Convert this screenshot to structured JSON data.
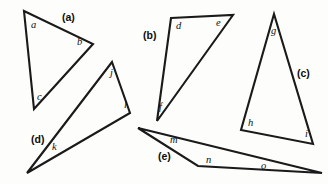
{
  "figure": {
    "canvas": {
      "width": 328,
      "height": 184
    },
    "background_color": "#fdfdfb",
    "stroke_color": "#1a1a1a",
    "label_color": "#111111",
    "triangles": [
      {
        "id": "a",
        "group_label": "(a)",
        "group_label_pos": {
          "x": 62,
          "y": 21
        },
        "points": "24,11 93,44 34,109",
        "angle_labels": [
          {
            "text": "a",
            "x": 31,
            "y": 28
          },
          {
            "text": "b",
            "x": 77,
            "y": 45
          },
          {
            "text": "c",
            "x": 37,
            "y": 100
          }
        ]
      },
      {
        "id": "b",
        "group_label": "(b)",
        "group_label_pos": {
          "x": 143,
          "y": 39
        },
        "points": "171,18 233,15 157,121",
        "angle_labels": [
          {
            "text": "d",
            "x": 176,
            "y": 29
          },
          {
            "text": "e",
            "x": 216,
            "y": 26
          },
          {
            "text": "f",
            "x": 159,
            "y": 110
          }
        ]
      },
      {
        "id": "c",
        "group_label": "(c)",
        "group_label_pos": {
          "x": 297,
          "y": 77
        },
        "points": "274,14 313,144 241,130",
        "angle_labels": [
          {
            "text": "g",
            "x": 271,
            "y": 34
          },
          {
            "text": "h",
            "x": 248,
            "y": 126
          },
          {
            "text": "i",
            "x": 305,
            "y": 137
          }
        ]
      },
      {
        "id": "d",
        "group_label": "(d)",
        "group_label_pos": {
          "x": 31,
          "y": 143
        },
        "points": "112,62 130,113 27,173",
        "angle_labels": [
          {
            "text": "j",
            "x": 110,
            "y": 76
          },
          {
            "text": "l",
            "x": 124,
            "y": 108
          },
          {
            "text": "k",
            "x": 52,
            "y": 150
          }
        ]
      },
      {
        "id": "e",
        "group_label": "(e)",
        "group_label_pos": {
          "x": 158,
          "y": 160
        },
        "points": "138,128 322,173 198,166",
        "angle_labels": [
          {
            "text": "m",
            "x": 170,
            "y": 143
          },
          {
            "text": "n",
            "x": 206,
            "y": 163
          },
          {
            "text": "o",
            "x": 261,
            "y": 169
          }
        ]
      }
    ]
  }
}
